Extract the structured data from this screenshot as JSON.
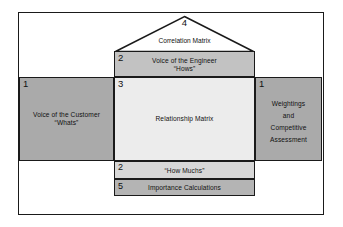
{
  "diagram": {
    "rooms": {
      "correlation": {
        "number": "4",
        "label": "Correlation Matrix",
        "fill": "#ffffff"
      },
      "engineer": {
        "number": "2",
        "line1": "Voice of the Engineer",
        "line2": "“Hows”",
        "fill": "#c2c2c2"
      },
      "customer": {
        "number": "1",
        "line1": "Voice of the Customer",
        "line2": "“Whats”",
        "fill": "#aaaaaa"
      },
      "relationship": {
        "number": "3",
        "label": "Relationship Matrix",
        "fill": "#ececec"
      },
      "weightings": {
        "number": "1",
        "line1": "Weightings",
        "line2": "and",
        "line3": "Competitive",
        "line4": "Assessment",
        "fill": "#aaaaaa"
      },
      "how_muchs": {
        "number": "2",
        "label": "“How Muchs”",
        "fill": "#d7d7d7"
      },
      "importance": {
        "number": "5",
        "label": "Importance Calculations",
        "fill": "#b4b4b4"
      }
    },
    "colors": {
      "outline": "#1a1a1a",
      "background": "#ffffff",
      "text": "#111111"
    }
  }
}
